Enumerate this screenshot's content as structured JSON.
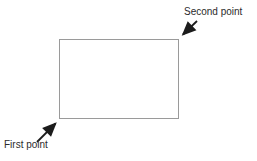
{
  "diagram": {
    "type": "annotated-rectangle",
    "labels": {
      "first_point": "First point",
      "second_point": "Second point"
    },
    "colors": {
      "rectangle_border": "#9a9a9a",
      "arrow": "#1c1c1c",
      "text": "#2b2b2b",
      "background": "#ffffff"
    },
    "annotations": [
      {
        "label": "Second point",
        "points_to": "top-right corner of rectangle",
        "label_position": "top-right"
      },
      {
        "label": "First point",
        "points_to": "bottom-left corner of rectangle",
        "label_position": "bottom-left"
      }
    ]
  }
}
